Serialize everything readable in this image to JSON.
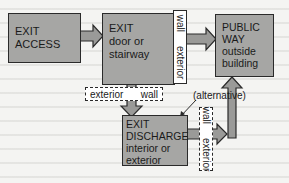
{
  "diagram": {
    "nodes": {
      "exit_access": {
        "line1": "EXIT",
        "line2": "ACCESS"
      },
      "exit": {
        "line1": "EXIT",
        "line2": "door or",
        "line3": "stairway"
      },
      "public_way": {
        "line1": "PUBLIC",
        "line2": "WAY",
        "line3": "outside",
        "line4": "building"
      },
      "exit_discharge": {
        "line1": "EXIT",
        "line2": "DISCHARGE",
        "line3": "interior or",
        "line4": "exterior"
      }
    },
    "walls": {
      "top_vertical": {
        "word1": "exterior",
        "word2": "wall"
      },
      "middle_horizontal": {
        "word1": "exterior",
        "word2": "wall"
      },
      "bottom_vertical": {
        "word1": "exterior",
        "word2": "wall"
      }
    },
    "annotations": {
      "alternative": "(alternative)"
    },
    "colors": {
      "box_fill": "#a6a6a4",
      "arrow_fill": "#9a9a98",
      "outline": "#2a2a2a",
      "background": "#f4f4f2"
    },
    "edges": [
      {
        "from": "EXIT ACCESS",
        "to": "EXIT"
      },
      {
        "from": "EXIT",
        "to": "PUBLIC WAY"
      },
      {
        "from": "EXIT",
        "to": "EXIT DISCHARGE"
      },
      {
        "from": "EXIT DISCHARGE",
        "to": "PUBLIC WAY"
      }
    ]
  }
}
